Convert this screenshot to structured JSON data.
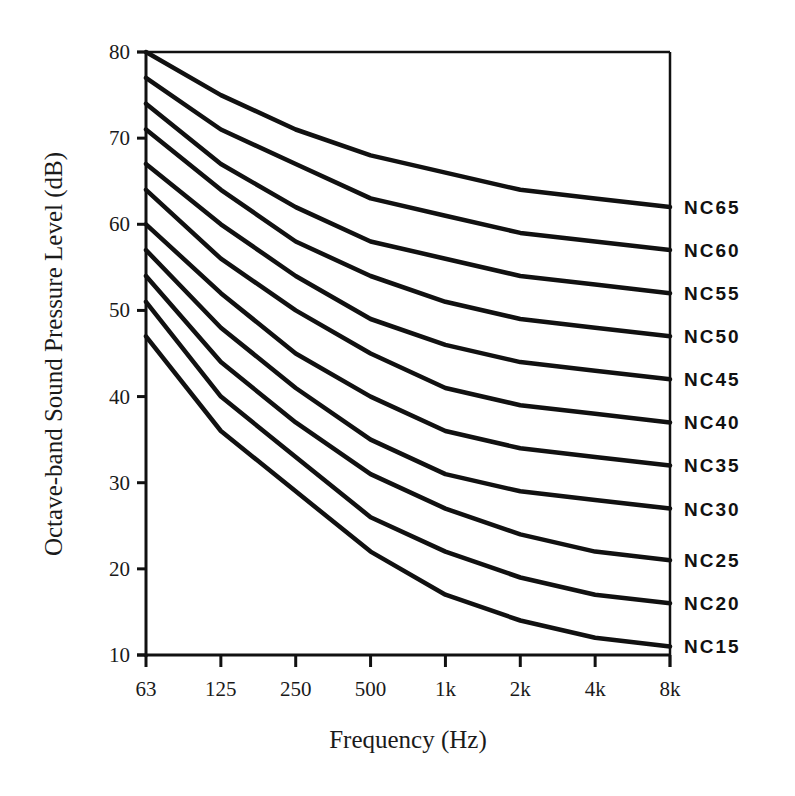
{
  "chart_data": {
    "type": "line",
    "title": "",
    "xlabel": "Frequency (Hz)",
    "ylabel": "Octave-band Sound Pressure Level (dB)",
    "categories": [
      "63",
      "125",
      "250",
      "500",
      "1k",
      "2k",
      "4k",
      "8k"
    ],
    "ylim": [
      10,
      80
    ],
    "yticks": [
      10,
      20,
      30,
      40,
      50,
      60,
      70,
      80
    ],
    "grid": false,
    "legend_position": "right-inline-labels",
    "series": [
      {
        "name": "NC65",
        "values": [
          80,
          75,
          71,
          68,
          66,
          64,
          63,
          62
        ]
      },
      {
        "name": "NC60",
        "values": [
          77,
          71,
          67,
          63,
          61,
          59,
          58,
          57
        ]
      },
      {
        "name": "NC55",
        "values": [
          74,
          67,
          62,
          58,
          56,
          54,
          53,
          52
        ]
      },
      {
        "name": "NC50",
        "values": [
          71,
          64,
          58,
          54,
          51,
          49,
          48,
          47
        ]
      },
      {
        "name": "NC45",
        "values": [
          67,
          60,
          54,
          49,
          46,
          44,
          43,
          42
        ]
      },
      {
        "name": "NC40",
        "values": [
          64,
          56,
          50,
          45,
          41,
          39,
          38,
          37
        ]
      },
      {
        "name": "NC35",
        "values": [
          60,
          52,
          45,
          40,
          36,
          34,
          33,
          32
        ]
      },
      {
        "name": "NC30",
        "values": [
          57,
          48,
          41,
          35,
          31,
          29,
          28,
          27
        ]
      },
      {
        "name": "NC25",
        "values": [
          54,
          44,
          37,
          31,
          27,
          24,
          22,
          21
        ]
      },
      {
        "name": "NC20",
        "values": [
          51,
          40,
          33,
          26,
          22,
          19,
          17,
          16
        ]
      },
      {
        "name": "NC15",
        "values": [
          47,
          36,
          29,
          22,
          17,
          14,
          12,
          11
        ]
      }
    ],
    "label_offsets": {
      "NC65": 0,
      "NC60": 0,
      "NC55": 0,
      "NC50": 0,
      "NC45": 0,
      "NC40": 0,
      "NC35": 0,
      "NC30": 0,
      "NC25": 0,
      "NC20": 0,
      "NC15": 0
    }
  }
}
